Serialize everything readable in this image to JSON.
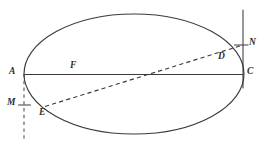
{
  "figure": {
    "kind": "geometry-diagram",
    "background_color": "#ffffff",
    "stroke_color": "#3b3b3b",
    "width": 267,
    "height": 147,
    "ellipse": {
      "center_x": 134,
      "center_y": 74,
      "radius_x": 110,
      "radius_y": 60
    },
    "points": [
      {
        "id": "A",
        "label": "A",
        "x": 24,
        "y": 74,
        "label_x": 9,
        "label_y": 68,
        "on": "ellipse-left-vertex"
      },
      {
        "id": "F",
        "label": "F",
        "x": 75,
        "y": 74,
        "label_x": 70,
        "label_y": 62,
        "on": "major-axis-focus"
      },
      {
        "id": "C",
        "label": "C",
        "x": 243,
        "y": 74,
        "label_x": 247,
        "label_y": 68,
        "on": "ellipse-right-vertex"
      },
      {
        "id": "D",
        "label": "D",
        "x": 224,
        "y": 49,
        "label_x": 219,
        "label_y": 52,
        "on": "ellipse-upper-right"
      },
      {
        "id": "N",
        "label": "N",
        "x": 243,
        "y": 45,
        "label_x": 249,
        "label_y": 39,
        "on": "right-vertical-line"
      },
      {
        "id": "E",
        "label": "E",
        "x": 45,
        "y": 106,
        "label_x": 40,
        "label_y": 108,
        "on": "ellipse-lower-left"
      },
      {
        "id": "M",
        "label": "M",
        "x": 24,
        "y": 105,
        "label_x": 8,
        "label_y": 99,
        "on": "left-vertical-dashed-line"
      }
    ],
    "segments": [
      {
        "id": "major-axis",
        "name": "segment-AC",
        "from": "A",
        "to": "C",
        "style": "solid"
      },
      {
        "id": "chord-EFDN",
        "name": "dashed-chord-through-focus",
        "from": "E",
        "to": "N",
        "style": "dashed"
      },
      {
        "id": "right-directrix",
        "name": "right-vertical-line",
        "style": "solid",
        "x": 243,
        "y1": 10,
        "y2": 88
      },
      {
        "id": "left-directrix",
        "name": "left-vertical-dashed-line",
        "style": "dashed",
        "x": 24,
        "y1": 74,
        "y2": 141
      },
      {
        "id": "tick-N",
        "name": "tick-at-N",
        "style": "solid",
        "x1": 235,
        "x2": 248,
        "y": 45
      },
      {
        "id": "tick-M",
        "name": "tick-at-M",
        "style": "solid",
        "x1": 19,
        "x2": 31,
        "y": 105
      }
    ]
  }
}
